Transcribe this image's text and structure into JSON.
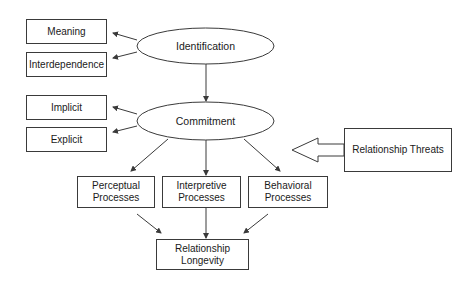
{
  "diagram": {
    "type": "flowchart",
    "nodes": {
      "identification": {
        "label": "Identification",
        "shape": "ellipse"
      },
      "commitment": {
        "label": "Commitment",
        "shape": "ellipse"
      },
      "meaning": {
        "label": "Meaning",
        "shape": "rectangle"
      },
      "interdependence": {
        "label": "Interdependence",
        "shape": "rectangle"
      },
      "implicit": {
        "label": "Implicit",
        "shape": "rectangle"
      },
      "explicit": {
        "label": "Explicit",
        "shape": "rectangle"
      },
      "perceptual": {
        "label": "Perceptual\nProcesses",
        "shape": "rectangle"
      },
      "interpretive": {
        "label": "Interpretive\nProcesses",
        "shape": "rectangle"
      },
      "behavioral": {
        "label": "Behavioral\nProcesses",
        "shape": "rectangle"
      },
      "longevity": {
        "label": "Relationship\nLongevity",
        "shape": "rectangle"
      },
      "threats": {
        "label": "Relationship Threats",
        "shape": "rectangle"
      }
    },
    "edges": [
      {
        "from": "identification",
        "to": "meaning",
        "style": "arrow"
      },
      {
        "from": "identification",
        "to": "interdependence",
        "style": "arrow"
      },
      {
        "from": "identification",
        "to": "commitment",
        "style": "arrow"
      },
      {
        "from": "commitment",
        "to": "implicit",
        "style": "arrow"
      },
      {
        "from": "commitment",
        "to": "explicit",
        "style": "arrow"
      },
      {
        "from": "commitment",
        "to": "perceptual",
        "style": "arrow"
      },
      {
        "from": "commitment",
        "to": "interpretive",
        "style": "arrow"
      },
      {
        "from": "commitment",
        "to": "behavioral",
        "style": "arrow"
      },
      {
        "from": "perceptual",
        "to": "longevity",
        "style": "arrow"
      },
      {
        "from": "interpretive",
        "to": "longevity",
        "style": "arrow"
      },
      {
        "from": "behavioral",
        "to": "longevity",
        "style": "arrow"
      },
      {
        "from": "threats",
        "to": "commitment",
        "style": "block-arrow"
      }
    ],
    "colors": {
      "stroke": "#3a3a3a",
      "fill": "#ffffff",
      "text": "#1a1a1a"
    }
  }
}
